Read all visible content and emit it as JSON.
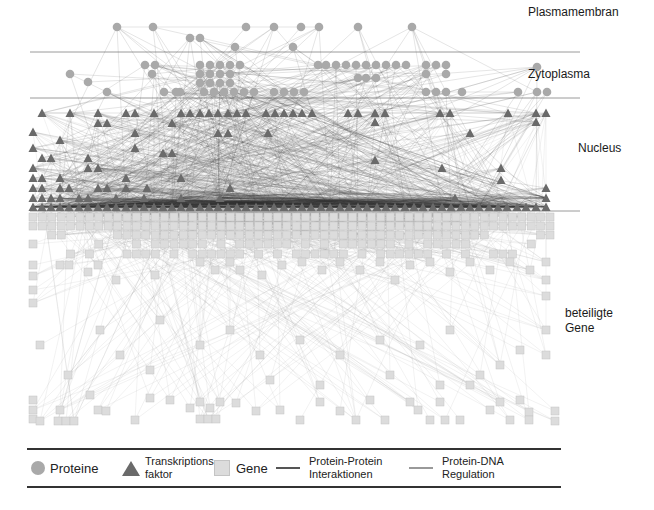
{
  "layers": [
    {
      "name": "Plasmamembran",
      "label": "Plasmamembran",
      "x": 528,
      "y": 5,
      "line_y": 52
    },
    {
      "name": "Zytoplasma",
      "label": "Zytoplasma",
      "x": 528,
      "y": 67,
      "line_y": 98
    },
    {
      "name": "Nucleus",
      "label": "Nucleus",
      "x": 578,
      "y": 141,
      "line_y": 211
    },
    {
      "name": "beteiligte Gene",
      "label": "beteiligte\nGene",
      "label_line1": "beteiligte",
      "label_line2": "Gene",
      "x": 565,
      "y": 306
    }
  ],
  "separator": {
    "x1": 30,
    "x2": 580,
    "color": "#9a9a9a"
  },
  "legend": {
    "proteins": "Proteine",
    "tf_line1": "Transkriptions-",
    "tf_line2": "faktor",
    "genes": "Gene",
    "ppi_line1": "Protein-Protein",
    "ppi_line2": "Interaktionen",
    "pdna_line1": "Protein-DNA",
    "pdna_line2": "Regulation"
  },
  "colors": {
    "protein_node": "#a9a9a9",
    "tf_node": "#6a6a6a",
    "gene_node": "#dcdcdc",
    "gene_border": "#c4c4c4",
    "ppi_edge": "#555555",
    "pdna_edge": "#9e9e9e"
  },
  "nodes": {
    "membrane_proteins": [
      [
        117,
        27
      ],
      [
        153,
        27
      ],
      [
        246,
        27
      ],
      [
        274,
        27
      ],
      [
        301,
        27
      ],
      [
        319,
        27
      ],
      [
        358,
        27
      ],
      [
        412,
        27
      ],
      [
        190,
        38
      ],
      [
        200,
        38
      ],
      [
        235,
        47
      ],
      [
        293,
        47
      ]
    ],
    "cytoplasm_proteins": [
      [
        70,
        74
      ],
      [
        88,
        82
      ],
      [
        107,
        92
      ],
      [
        145,
        65
      ],
      [
        155,
        65
      ],
      [
        152,
        74
      ],
      [
        164,
        92
      ],
      [
        180,
        92
      ],
      [
        200,
        65
      ],
      [
        210,
        65
      ],
      [
        220,
        65
      ],
      [
        230,
        65
      ],
      [
        240,
        65
      ],
      [
        200,
        74
      ],
      [
        210,
        74
      ],
      [
        220,
        74
      ],
      [
        230,
        74
      ],
      [
        200,
        83
      ],
      [
        210,
        83
      ],
      [
        220,
        83
      ],
      [
        230,
        83
      ],
      [
        176,
        92
      ],
      [
        204,
        92
      ],
      [
        214,
        92
      ],
      [
        224,
        92
      ],
      [
        234,
        92
      ],
      [
        244,
        92
      ],
      [
        254,
        92
      ],
      [
        274,
        92
      ],
      [
        284,
        92
      ],
      [
        294,
        92
      ],
      [
        304,
        92
      ],
      [
        318,
        65
      ],
      [
        326,
        65
      ],
      [
        336,
        65
      ],
      [
        346,
        65
      ],
      [
        356,
        65
      ],
      [
        366,
        65
      ],
      [
        376,
        65
      ],
      [
        386,
        65
      ],
      [
        396,
        65
      ],
      [
        406,
        65
      ],
      [
        426,
        65
      ],
      [
        436,
        65
      ],
      [
        446,
        65
      ],
      [
        426,
        74
      ],
      [
        446,
        74
      ],
      [
        358,
        78
      ],
      [
        366,
        78
      ],
      [
        376,
        78
      ],
      [
        426,
        92
      ],
      [
        436,
        92
      ],
      [
        446,
        92
      ],
      [
        462,
        92
      ],
      [
        518,
        92
      ],
      [
        537,
        92
      ],
      [
        547,
        92
      ],
      [
        537,
        67
      ]
    ],
    "tfs": [
      [
        42,
        113
      ],
      [
        70,
        113
      ],
      [
        98,
        113
      ],
      [
        126,
        113
      ],
      [
        135,
        113
      ],
      [
        154,
        113
      ],
      [
        181,
        113
      ],
      [
        190,
        113
      ],
      [
        200,
        113
      ],
      [
        209,
        113
      ],
      [
        218,
        113
      ],
      [
        228,
        113
      ],
      [
        237,
        113
      ],
      [
        246,
        113
      ],
      [
        266,
        113
      ],
      [
        275,
        113
      ],
      [
        284,
        113
      ],
      [
        293,
        113
      ],
      [
        302,
        113
      ],
      [
        312,
        113
      ],
      [
        348,
        113
      ],
      [
        358,
        113
      ],
      [
        375,
        113
      ],
      [
        385,
        113
      ],
      [
        440,
        113
      ],
      [
        450,
        113
      ],
      [
        508,
        113
      ],
      [
        536,
        113
      ],
      [
        546,
        113
      ],
      [
        98,
        123
      ],
      [
        107,
        123
      ],
      [
        172,
        123
      ],
      [
        375,
        122
      ],
      [
        536,
        122
      ],
      [
        33,
        132
      ],
      [
        60,
        140
      ],
      [
        135,
        133
      ],
      [
        218,
        133
      ],
      [
        228,
        133
      ],
      [
        268,
        133
      ],
      [
        470,
        133
      ],
      [
        33,
        148
      ],
      [
        135,
        148
      ],
      [
        163,
        153
      ],
      [
        172,
        153
      ],
      [
        375,
        160
      ],
      [
        42,
        158
      ],
      [
        51,
        158
      ],
      [
        88,
        158
      ],
      [
        33,
        168
      ],
      [
        88,
        168
      ],
      [
        98,
        168
      ],
      [
        33,
        178
      ],
      [
        42,
        178
      ],
      [
        60,
        178
      ],
      [
        126,
        178
      ],
      [
        181,
        178
      ],
      [
        442,
        168
      ],
      [
        501,
        168
      ],
      [
        33,
        188
      ],
      [
        42,
        188
      ],
      [
        60,
        188
      ],
      [
        69,
        188
      ],
      [
        98,
        188
      ],
      [
        107,
        188
      ],
      [
        126,
        188
      ],
      [
        147,
        188
      ],
      [
        230,
        188
      ],
      [
        501,
        180
      ],
      [
        546,
        188
      ],
      [
        33,
        198
      ],
      [
        42,
        198
      ],
      [
        51,
        198
      ],
      [
        60,
        198
      ],
      [
        79,
        198
      ],
      [
        88,
        198
      ],
      [
        116,
        198
      ],
      [
        144,
        198
      ],
      [
        181,
        198
      ],
      [
        220,
        198
      ],
      [
        455,
        198
      ],
      [
        546,
        198
      ],
      [
        33,
        207
      ],
      [
        42,
        207
      ],
      [
        51,
        207
      ],
      [
        60,
        207
      ],
      [
        69,
        207
      ],
      [
        79,
        207
      ],
      [
        88,
        207
      ],
      [
        98,
        207
      ],
      [
        107,
        207
      ],
      [
        116,
        207
      ],
      [
        126,
        207
      ],
      [
        135,
        207
      ],
      [
        144,
        207
      ],
      [
        154,
        207
      ],
      [
        163,
        207
      ],
      [
        172,
        207
      ],
      [
        181,
        207
      ],
      [
        190,
        207
      ],
      [
        200,
        207
      ],
      [
        209,
        207
      ],
      [
        218,
        207
      ],
      [
        228,
        207
      ],
      [
        237,
        207
      ],
      [
        246,
        207
      ],
      [
        256,
        207
      ],
      [
        265,
        207
      ],
      [
        274,
        207
      ],
      [
        284,
        207
      ],
      [
        293,
        207
      ],
      [
        302,
        207
      ],
      [
        311,
        207
      ],
      [
        321,
        207
      ],
      [
        330,
        207
      ],
      [
        340,
        207
      ],
      [
        349,
        207
      ],
      [
        358,
        207
      ],
      [
        367,
        207
      ],
      [
        377,
        207
      ],
      [
        386,
        207
      ],
      [
        395,
        207
      ],
      [
        405,
        207
      ],
      [
        414,
        207
      ],
      [
        423,
        207
      ],
      [
        433,
        207
      ],
      [
        442,
        207
      ],
      [
        451,
        207
      ],
      [
        461,
        207
      ],
      [
        470,
        207
      ],
      [
        479,
        207
      ],
      [
        489,
        207
      ],
      [
        498,
        207
      ],
      [
        507,
        207
      ],
      [
        517,
        207
      ],
      [
        526,
        207
      ],
      [
        536,
        207
      ],
      [
        546,
        207
      ]
    ],
    "gene_grid": {
      "x_start": 33,
      "x_end": 552,
      "step": 9.4,
      "rows": [
        217,
        226,
        235,
        244,
        254
      ]
    },
    "genes_scattered": [
      [
        33,
        265
      ],
      [
        33,
        276
      ],
      [
        33,
        290
      ],
      [
        33,
        303
      ],
      [
        60,
        265
      ],
      [
        69,
        265
      ],
      [
        88,
        272
      ],
      [
        98,
        265
      ],
      [
        116,
        280
      ],
      [
        155,
        275
      ],
      [
        200,
        262
      ],
      [
        215,
        270
      ],
      [
        230,
        262
      ],
      [
        240,
        270
      ],
      [
        262,
        275
      ],
      [
        282,
        265
      ],
      [
        302,
        262
      ],
      [
        322,
        270
      ],
      [
        340,
        262
      ],
      [
        360,
        270
      ],
      [
        380,
        262
      ],
      [
        395,
        280
      ],
      [
        410,
        265
      ],
      [
        430,
        262
      ],
      [
        450,
        272
      ],
      [
        470,
        262
      ],
      [
        490,
        270
      ],
      [
        510,
        262
      ],
      [
        530,
        270
      ],
      [
        546,
        262
      ],
      [
        546,
        280
      ],
      [
        546,
        296
      ],
      [
        546,
        330
      ],
      [
        546,
        355
      ],
      [
        40,
        345
      ],
      [
        68,
        375
      ],
      [
        90,
        395
      ],
      [
        60,
        410
      ],
      [
        33,
        400
      ],
      [
        33,
        410
      ],
      [
        33,
        419
      ],
      [
        40,
        421
      ],
      [
        58,
        421
      ],
      [
        66,
        421
      ],
      [
        74,
        421
      ],
      [
        98,
        410
      ],
      [
        106,
        411
      ],
      [
        135,
        420
      ],
      [
        150,
        398
      ],
      [
        170,
        400
      ],
      [
        190,
        408
      ],
      [
        200,
        402
      ],
      [
        210,
        408
      ],
      [
        220,
        402
      ],
      [
        200,
        419
      ],
      [
        208,
        419
      ],
      [
        216,
        419
      ],
      [
        236,
        403
      ],
      [
        256,
        411
      ],
      [
        280,
        410
      ],
      [
        300,
        420
      ],
      [
        320,
        402
      ],
      [
        340,
        411
      ],
      [
        356,
        420
      ],
      [
        370,
        400
      ],
      [
        385,
        420
      ],
      [
        410,
        402
      ],
      [
        418,
        410
      ],
      [
        430,
        420
      ],
      [
        440,
        402
      ],
      [
        445,
        420
      ],
      [
        460,
        420
      ],
      [
        490,
        410
      ],
      [
        500,
        402
      ],
      [
        510,
        420
      ],
      [
        520,
        400
      ],
      [
        529,
        412
      ],
      [
        529,
        420
      ],
      [
        555,
        411
      ],
      [
        555,
        421
      ],
      [
        470,
        385
      ],
      [
        480,
        375
      ],
      [
        500,
        365
      ],
      [
        520,
        350
      ],
      [
        200,
        345
      ],
      [
        230,
        330
      ],
      [
        260,
        355
      ],
      [
        300,
        340
      ],
      [
        340,
        355
      ],
      [
        380,
        340
      ],
      [
        420,
        345
      ],
      [
        450,
        330
      ],
      [
        100,
        330
      ],
      [
        120,
        355
      ],
      [
        160,
        320
      ],
      [
        150,
        370
      ],
      [
        270,
        380
      ],
      [
        320,
        385
      ],
      [
        390,
        375
      ],
      [
        440,
        385
      ]
    ]
  }
}
